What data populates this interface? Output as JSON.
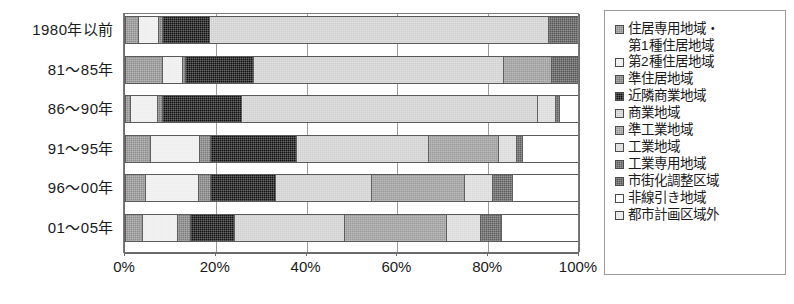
{
  "chart_data": {
    "type": "bar",
    "orientation": "horizontal",
    "stacked": true,
    "normalized_percent": true,
    "title": "",
    "xlabel": "",
    "ylabel": "",
    "xlim": [
      0,
      100
    ],
    "grid": true,
    "legend_position": "right",
    "xtick_labels": [
      "0%",
      "20%",
      "40%",
      "60%",
      "80%",
      "100%"
    ],
    "xticks": [
      0,
      20,
      40,
      60,
      80,
      100
    ],
    "categories": [
      "1980年以前",
      "81～85年",
      "86～90年",
      "91～95年",
      "96～00年",
      "01～05年"
    ],
    "series": [
      {
        "name": "住居専用地域・第1種住居地域",
        "key": "p0",
        "values": [
          2.6,
          7.9,
          0.9,
          5.3,
          4.2,
          3.5
        ]
      },
      {
        "name": "第2種住居地域",
        "key": "p1",
        "values": [
          4.4,
          4.4,
          5.9,
          10.8,
          11.7,
          7.7
        ]
      },
      {
        "name": "準住居地域",
        "key": "p2",
        "values": [
          0.9,
          0.7,
          1.1,
          2.4,
          2.6,
          2.9
        ]
      },
      {
        "name": "近隣商業地域",
        "key": "p3",
        "values": [
          10.4,
          15.2,
          17.6,
          19.2,
          14.5,
          9.9
        ]
      },
      {
        "name": "商業地域",
        "key": "p4",
        "values": [
          75.1,
          55.3,
          65.4,
          29.1,
          21.1,
          24.2
        ]
      },
      {
        "name": "準工業地域",
        "key": "p5",
        "values": [
          0.0,
          10.6,
          0.0,
          15.4,
          20.7,
          22.5
        ]
      },
      {
        "name": "工業地域",
        "key": "p6",
        "values": [
          0.0,
          0.0,
          4.0,
          4.0,
          6.2,
          7.7
        ]
      },
      {
        "name": "工業専用地域",
        "key": "p7",
        "values": [
          0.0,
          0.0,
          0.9,
          1.5,
          4.4,
          4.6
        ]
      },
      {
        "name": "市街化調整区域",
        "key": "p8",
        "values": [
          6.6,
          5.9,
          0.0,
          0.0,
          0.0,
          0.0
        ]
      },
      {
        "name": "非線引き地域",
        "key": "p9",
        "values": [
          0.0,
          0.0,
          4.2,
          12.3,
          14.6,
          17.0
        ]
      },
      {
        "name": "都市計画区域外",
        "key": "p10",
        "values": [
          0.0,
          0.0,
          0.0,
          0.0,
          0.0,
          0.0
        ]
      }
    ]
  },
  "legend": {
    "items": [
      {
        "label": "住居専用地域・",
        "label2": "第1種住居地域",
        "swatch": "p0"
      },
      {
        "label": "第2種住居地域",
        "swatch": "p1"
      },
      {
        "label": "準住居地域",
        "swatch": "p2"
      },
      {
        "label": "近隣商業地域",
        "swatch": "p3"
      },
      {
        "label": "商業地域",
        "swatch": "p4"
      },
      {
        "label": "準工業地域",
        "swatch": "p5"
      },
      {
        "label": "工業地域",
        "swatch": "p6"
      },
      {
        "label": "工業専用地域",
        "swatch": "p7"
      },
      {
        "label": "市街化調整区域",
        "swatch": "p8"
      },
      {
        "label": "非線引き地域",
        "swatch": "p9"
      },
      {
        "label": "都市計画区域外",
        "swatch": "p10"
      }
    ]
  },
  "colors": {
    "p0": "#8d8d8d",
    "p1": "#ededed",
    "p2": "#7d7d7d",
    "p3": "#111111",
    "p4": "#cfcfcf",
    "p5": "#999999",
    "p6": "#d9d9d9",
    "p7": "#5e5e5e",
    "p8": "#565656",
    "p9": "#ffffff",
    "p10": "#e6e6e6",
    "axis": "#6b6b6b",
    "border": "#5a5a5a",
    "text": "#1a1a1a"
  }
}
